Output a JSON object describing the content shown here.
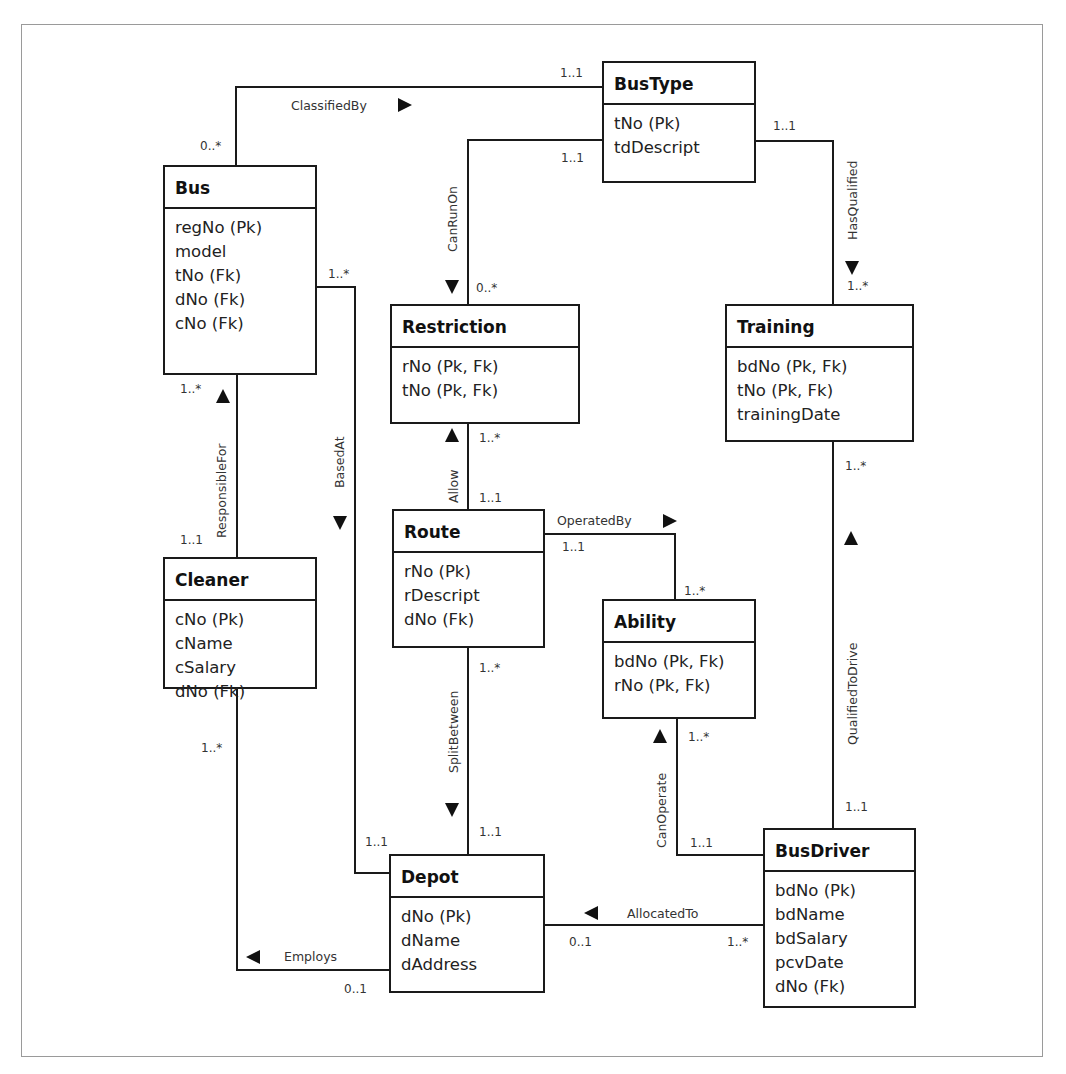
{
  "diagram": {
    "type": "uml-class-er-diagram",
    "entities": [
      {
        "id": "bustype",
        "name": "BusType",
        "x": 603,
        "y": 62,
        "w": 152,
        "h": 120,
        "title_h": 42,
        "attrs": [
          "tNo (Pk)",
          "tdDescript"
        ]
      },
      {
        "id": "bus",
        "name": "Bus",
        "x": 164,
        "y": 166,
        "w": 152,
        "h": 208,
        "title_h": 42,
        "attrs": [
          "regNo (Pk)",
          "model",
          "tNo (Fk)",
          "dNo (Fk)",
          "cNo (Fk)"
        ]
      },
      {
        "id": "restriction",
        "name": "Restriction",
        "x": 391,
        "y": 305,
        "w": 188,
        "h": 118,
        "title_h": 42,
        "attrs": [
          "rNo (Pk, Fk)",
          "tNo (Pk, Fk)"
        ]
      },
      {
        "id": "training",
        "name": "Training",
        "x": 726,
        "y": 305,
        "w": 187,
        "h": 136,
        "title_h": 42,
        "attrs": [
          "bdNo (Pk, Fk)",
          "tNo (Pk, Fk)",
          "trainingDate"
        ]
      },
      {
        "id": "route",
        "name": "Route",
        "x": 393,
        "y": 510,
        "w": 151,
        "h": 137,
        "title_h": 42,
        "attrs": [
          "rNo (Pk)",
          "rDescript",
          "dNo (Fk)"
        ]
      },
      {
        "id": "cleaner",
        "name": "Cleaner",
        "x": 164,
        "y": 558,
        "w": 152,
        "h": 130,
        "title_h": 42,
        "attrs": [
          "cNo (Pk)",
          "cName",
          "cSalary",
          "dNo (Fk)"
        ]
      },
      {
        "id": "ability",
        "name": "Ability",
        "x": 603,
        "y": 600,
        "w": 152,
        "h": 118,
        "title_h": 42,
        "attrs": [
          "bdNo (Pk, Fk)",
          "rNo (Pk, Fk)"
        ]
      },
      {
        "id": "depot",
        "name": "Depot",
        "x": 390,
        "y": 855,
        "w": 154,
        "h": 137,
        "title_h": 42,
        "attrs": [
          "dNo (Pk)",
          "dName",
          "dAddress"
        ]
      },
      {
        "id": "busdriver",
        "name": "BusDriver",
        "x": 764,
        "y": 829,
        "w": 151,
        "h": 178,
        "title_h": 42,
        "attrs": [
          "bdNo (Pk)",
          "bdName",
          "bdSalary",
          "pcvDate",
          "dNo (Fk)"
        ]
      }
    ],
    "relationships": [
      {
        "id": "classifiedby",
        "name": "ClassifiedBy",
        "from": "Bus",
        "to": "BusType",
        "points": [
          [
            236,
            166
          ],
          [
            236,
            87
          ],
          [
            603,
            87
          ]
        ],
        "label": {
          "text": "ClassifiedBy",
          "x": 291,
          "y": 110,
          "rotate": 0
        },
        "arrow": {
          "dir": "right",
          "x": 405,
          "y": 105
        },
        "mults": [
          {
            "text": "0..*",
            "x": 200,
            "y": 150
          },
          {
            "text": "1..1",
            "x": 560,
            "y": 77
          }
        ]
      },
      {
        "id": "canrunon",
        "name": "CanRunOn",
        "from": "BusType",
        "to": "Restriction",
        "points": [
          [
            603,
            140
          ],
          [
            468,
            140
          ],
          [
            468,
            305
          ]
        ],
        "label": {
          "text": "CanRunOn",
          "x": 457,
          "y": 252,
          "rotate": -90
        },
        "arrow": {
          "dir": "down",
          "x": 452,
          "y": 287
        },
        "mults": [
          {
            "text": "1..1",
            "x": 561,
            "y": 162
          },
          {
            "text": "0..*",
            "x": 476,
            "y": 292
          }
        ]
      },
      {
        "id": "hasqualified",
        "name": "HasQualified",
        "from": "BusType",
        "to": "Training",
        "points": [
          [
            755,
            141
          ],
          [
            833,
            141
          ],
          [
            833,
            305
          ]
        ],
        "label": {
          "text": "HasQualified",
          "x": 857,
          "y": 240,
          "rotate": -90
        },
        "arrow": {
          "dir": "down",
          "x": 852,
          "y": 268
        },
        "mults": [
          {
            "text": "1..1",
            "x": 773,
            "y": 130
          },
          {
            "text": "1..*",
            "x": 847,
            "y": 290
          }
        ]
      },
      {
        "id": "basedat",
        "name": "BasedAt",
        "from": "Bus",
        "to": "Depot",
        "points": [
          [
            316,
            287
          ],
          [
            355,
            287
          ],
          [
            355,
            873
          ],
          [
            390,
            873
          ]
        ],
        "label": {
          "text": "BasedAt",
          "x": 344,
          "y": 488,
          "rotate": -90
        },
        "arrow": {
          "dir": "down",
          "x": 340,
          "y": 523
        },
        "mults": [
          {
            "text": "1..*",
            "x": 328,
            "y": 278
          },
          {
            "text": "1..1",
            "x": 365,
            "y": 846
          }
        ]
      },
      {
        "id": "responsiblefor",
        "name": "ResponsibleFor",
        "from": "Cleaner",
        "to": "Bus",
        "points": [
          [
            237,
            374
          ],
          [
            237,
            558
          ]
        ],
        "label": {
          "text": "ResponsibleFor",
          "x": 226,
          "y": 538,
          "rotate": -90
        },
        "arrow": {
          "dir": "up",
          "x": 223,
          "y": 396
        },
        "mults": [
          {
            "text": "1..*",
            "x": 180,
            "y": 393
          },
          {
            "text": "1..1",
            "x": 180,
            "y": 544
          }
        ]
      },
      {
        "id": "allow",
        "name": "Allow",
        "from": "Route",
        "to": "Restriction",
        "points": [
          [
            468,
            423
          ],
          [
            468,
            510
          ]
        ],
        "label": {
          "text": "Allow",
          "x": 458,
          "y": 503,
          "rotate": -90
        },
        "arrow": {
          "dir": "up",
          "x": 452,
          "y": 435
        },
        "mults": [
          {
            "text": "1..*",
            "x": 479,
            "y": 442
          },
          {
            "text": "1..1",
            "x": 479,
            "y": 502
          }
        ]
      },
      {
        "id": "operatedby",
        "name": "OperatedBy",
        "from": "Route",
        "to": "Ability",
        "points": [
          [
            544,
            534
          ],
          [
            675,
            534
          ],
          [
            675,
            600
          ]
        ],
        "label": {
          "text": "OperatedBy",
          "x": 557,
          "y": 525,
          "rotate": 0
        },
        "arrow": {
          "dir": "right",
          "x": 670,
          "y": 521
        },
        "mults": [
          {
            "text": "1..1",
            "x": 562,
            "y": 551
          },
          {
            "text": "1..*",
            "x": 684,
            "y": 595
          }
        ]
      },
      {
        "id": "splitbetween",
        "name": "SplitBetween",
        "from": "Route",
        "to": "Depot",
        "points": [
          [
            468,
            647
          ],
          [
            468,
            855
          ]
        ],
        "label": {
          "text": "SplitBetween",
          "x": 458,
          "y": 773,
          "rotate": -90
        },
        "arrow": {
          "dir": "down",
          "x": 452,
          "y": 810
        },
        "mults": [
          {
            "text": "1..*",
            "x": 479,
            "y": 672
          },
          {
            "text": "1..1",
            "x": 479,
            "y": 836
          }
        ]
      },
      {
        "id": "canoperate",
        "name": "CanOperate",
        "from": "BusDriver",
        "to": "Ability",
        "points": [
          [
            677,
            718
          ],
          [
            677,
            855
          ],
          [
            764,
            855
          ]
        ],
        "label": {
          "text": "CanOperate",
          "x": 666,
          "y": 848,
          "rotate": -90
        },
        "arrow": {
          "dir": "up",
          "x": 660,
          "y": 736
        },
        "mults": [
          {
            "text": "1..*",
            "x": 688,
            "y": 741
          },
          {
            "text": "1..1",
            "x": 690,
            "y": 847
          }
        ]
      },
      {
        "id": "qualifiedtodrive",
        "name": "QualifiedToDrive",
        "from": "BusDriver",
        "to": "Training",
        "points": [
          [
            833,
            441
          ],
          [
            833,
            829
          ]
        ],
        "label": {
          "text": "QualifiedToDrive",
          "x": 857,
          "y": 745,
          "rotate": -90
        },
        "arrow": {
          "dir": "up",
          "x": 851,
          "y": 538
        },
        "mults": [
          {
            "text": "1..*",
            "x": 845,
            "y": 470
          },
          {
            "text": "1..1",
            "x": 845,
            "y": 811
          }
        ]
      },
      {
        "id": "allocatedto",
        "name": "AllocatedTo",
        "from": "BusDriver",
        "to": "Depot",
        "points": [
          [
            544,
            925
          ],
          [
            764,
            925
          ]
        ],
        "label": {
          "text": "AllocatedTo",
          "x": 627,
          "y": 918,
          "rotate": 0
        },
        "arrow": {
          "dir": "left",
          "x": 591,
          "y": 913
        },
        "mults": [
          {
            "text": "0..1",
            "x": 569,
            "y": 946
          },
          {
            "text": "1..*",
            "x": 727,
            "y": 946
          }
        ]
      },
      {
        "id": "employs",
        "name": "Employs",
        "from": "Depot",
        "to": "Cleaner",
        "points": [
          [
            237,
            688
          ],
          [
            237,
            970
          ],
          [
            390,
            970
          ]
        ],
        "label": {
          "text": "Employs",
          "x": 284,
          "y": 961,
          "rotate": 0
        },
        "arrow": {
          "dir": "left",
          "x": 253,
          "y": 957
        },
        "mults": [
          {
            "text": "1..*",
            "x": 201,
            "y": 752
          },
          {
            "text": "0..1",
            "x": 344,
            "y": 993
          }
        ]
      }
    ]
  },
  "colors": {
    "line": "#1a1a1a",
    "frame": "#9a9a9a",
    "background": "#ffffff"
  }
}
